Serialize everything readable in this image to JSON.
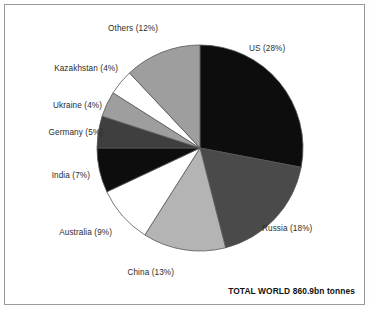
{
  "figure": {
    "background_color": "#ffffff",
    "frame_color": "#9a9a9a",
    "total_note": "TOTAL WORLD 860.9bn tonnes"
  },
  "chart_data": {
    "type": "pie",
    "title": "",
    "subtitle": "",
    "xlabel": "",
    "ylabel": "",
    "legend_position": "none",
    "grid": false,
    "annotations": [
      "TOTAL WORLD 860.9bn tonnes"
    ],
    "start_angle_deg": 0,
    "direction": "clockwise",
    "center": [
      200,
      148
    ],
    "radius": 103,
    "units": "percent",
    "categories": [
      "US",
      "Russia",
      "China",
      "Australia",
      "India",
      "Germany",
      "Ukraine",
      "Kazakhstan",
      "Others"
    ],
    "values": [
      28,
      18,
      13,
      9,
      7,
      5,
      4,
      4,
      12
    ],
    "labels": [
      "US (28%)",
      "Russia (18%)",
      "China (13%)",
      "Australia (9%)",
      "India (7%)",
      "Germany (5%)",
      "Ukraine (4%)",
      "Kazakhstan (4%)",
      "Others (12%)"
    ],
    "colors": [
      "#0d0d0d",
      "#4a4a4a",
      "#b4b4b4",
      "#ffffff",
      "#0d0d0d",
      "#3f3f3f",
      "#9e9e9e",
      "#ffffff",
      "#9e9e9e"
    ],
    "slice_edge_color": "#555555"
  }
}
